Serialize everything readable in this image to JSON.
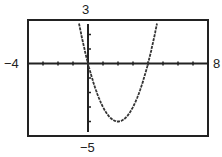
{
  "chart_data": {
    "type": "line",
    "title": "",
    "function": "y = x^2 - 4x",
    "xlim": [
      -4,
      8
    ],
    "ylim": [
      -5,
      3
    ],
    "xscale": 1,
    "yscale": 1,
    "window_labels": {
      "xmin": "−4",
      "xmax": "8",
      "ymax": "3",
      "ymin": "−5"
    },
    "series": [
      {
        "name": "y = x^2 - 4x",
        "x": [
          -0.6,
          0,
          1,
          2,
          3,
          4,
          4.6
        ],
        "y": [
          2.76,
          0,
          -3,
          -4,
          -3,
          0,
          2.76
        ]
      }
    ],
    "grid": false
  }
}
